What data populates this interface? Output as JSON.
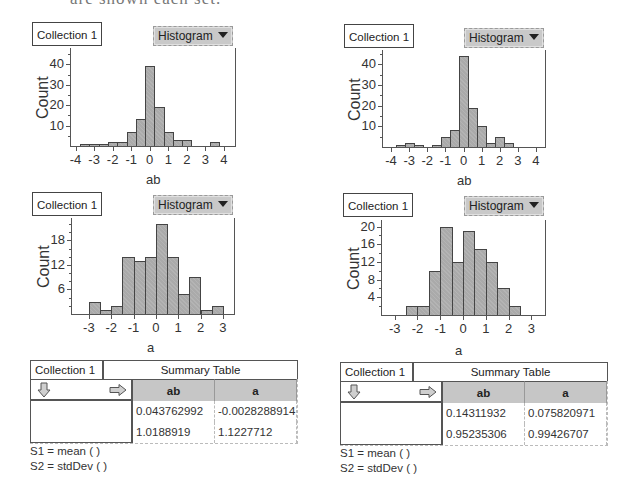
{
  "page": {
    "clipped_header_text": "are shown each set."
  },
  "colors": {
    "bar_fill": "#aaaaaa",
    "bar_stroke": "#444444",
    "button_bg": "#c9c9c9",
    "table_header_bg": "#c6c6c6"
  },
  "panels": [
    {
      "id": "top-left",
      "collection_label": "Collection 1",
      "plot_type_label": "Histogram",
      "ylabel": "Count",
      "xlabel": "ab",
      "layout": {
        "coll_x": 32,
        "coll_y": 22,
        "btn_x": 153,
        "btn_y": 26,
        "plot_x": 70,
        "plot_y": 48,
        "plot_w": 165,
        "plot_h": 98,
        "x_min": -4.3,
        "x_max": 4.6,
        "y_max": 48,
        "title_x": 146,
        "title_y": 172
      },
      "yticks": [
        10,
        20,
        30,
        40
      ],
      "yminor": 5,
      "xticks": [
        -4,
        -3,
        -2,
        -1,
        0,
        1,
        2,
        3,
        4
      ]
    },
    {
      "id": "top-right",
      "collection_label": "Collection 1",
      "plot_type_label": "Histogram",
      "ylabel": "Count",
      "xlabel": "ab",
      "layout": {
        "coll_x": 344,
        "coll_y": 24,
        "btn_x": 464,
        "btn_y": 28,
        "plot_x": 382,
        "plot_y": 50,
        "plot_w": 163,
        "plot_h": 97,
        "x_min": -4.5,
        "x_max": 4.5,
        "y_max": 47,
        "title_x": 457,
        "title_y": 173
      },
      "yticks": [
        10,
        20,
        30,
        40
      ],
      "yminor": 5,
      "xticks": [
        -4,
        -3,
        -2,
        -1,
        0,
        1,
        2,
        3,
        4
      ]
    },
    {
      "id": "middle-left",
      "collection_label": "Collection 1",
      "plot_type_label": "Histogram",
      "ylabel": "Count",
      "xlabel": "a",
      "layout": {
        "coll_x": 32,
        "coll_y": 192,
        "btn_x": 153,
        "btn_y": 195,
        "plot_x": 71,
        "plot_y": 218,
        "plot_w": 163,
        "plot_h": 96,
        "x_min": -3.8,
        "x_max": 3.5,
        "y_max": 23.5,
        "title_x": 147,
        "title_y": 340
      },
      "yticks": [
        6,
        12,
        18
      ],
      "yminor": 2,
      "xticks": [
        -3,
        -2,
        -1,
        0,
        1,
        2,
        3
      ]
    },
    {
      "id": "middle-right",
      "collection_label": "Collection 1",
      "plot_type_label": "Histogram",
      "ylabel": "Count",
      "xlabel": "a",
      "layout": {
        "coll_x": 343,
        "coll_y": 193,
        "btn_x": 464,
        "btn_y": 196,
        "plot_x": 381,
        "plot_y": 220,
        "plot_w": 164,
        "plot_h": 95,
        "x_min": -3.6,
        "x_max": 3.6,
        "y_max": 21.5,
        "title_x": 455,
        "title_y": 343
      },
      "yticks": [
        4,
        8,
        12,
        16,
        20
      ],
      "yminor": 2,
      "xticks": [
        -3,
        -2,
        -1,
        0,
        1,
        2,
        3
      ]
    }
  ],
  "chart_data": [
    {
      "type": "bar",
      "title": "Histogram of ab (Collection 1, left)",
      "xlabel": "ab",
      "ylabel": "Count",
      "bin_width": 0.5,
      "bins": [
        {
          "x0": -3.75,
          "x1": -3.25,
          "count": 1
        },
        {
          "x0": -3.25,
          "x1": -2.75,
          "count": 1
        },
        {
          "x0": -2.75,
          "x1": -2.25,
          "count": 1
        },
        {
          "x0": -2.25,
          "x1": -1.75,
          "count": 2
        },
        {
          "x0": -1.75,
          "x1": -1.25,
          "count": 2
        },
        {
          "x0": -1.25,
          "x1": -0.75,
          "count": 7
        },
        {
          "x0": -0.75,
          "x1": -0.25,
          "count": 13
        },
        {
          "x0": -0.25,
          "x1": 0.25,
          "count": 39
        },
        {
          "x0": 0.25,
          "x1": 0.75,
          "count": 19
        },
        {
          "x0": 0.75,
          "x1": 1.25,
          "count": 7
        },
        {
          "x0": 1.25,
          "x1": 1.75,
          "count": 3
        },
        {
          "x0": 1.75,
          "x1": 2.25,
          "count": 3
        },
        {
          "x0": 3.25,
          "x1": 3.75,
          "count": 2
        }
      ],
      "xlim": [
        -4.3,
        4.6
      ],
      "ylim": [
        0,
        48
      ],
      "xticks": [
        -4,
        -3,
        -2,
        -1,
        0,
        1,
        2,
        3,
        4
      ],
      "yticks": [
        10,
        20,
        30,
        40
      ]
    },
    {
      "type": "bar",
      "title": "Histogram of ab (Collection 1, right)",
      "xlabel": "ab",
      "ylabel": "Count",
      "bin_width": 0.5,
      "bins": [
        {
          "x0": -3.75,
          "x1": -3.25,
          "count": 1
        },
        {
          "x0": -3.25,
          "x1": -2.75,
          "count": 2
        },
        {
          "x0": -2.75,
          "x1": -2.25,
          "count": 1
        },
        {
          "x0": -1.75,
          "x1": -1.25,
          "count": 1
        },
        {
          "x0": -1.25,
          "x1": -0.75,
          "count": 5
        },
        {
          "x0": -0.75,
          "x1": -0.25,
          "count": 8
        },
        {
          "x0": -0.25,
          "x1": 0.25,
          "count": 44
        },
        {
          "x0": 0.25,
          "x1": 0.75,
          "count": 19
        },
        {
          "x0": 0.75,
          "x1": 1.25,
          "count": 10
        },
        {
          "x0": 1.25,
          "x1": 1.75,
          "count": 2
        },
        {
          "x0": 1.75,
          "x1": 2.25,
          "count": 5
        },
        {
          "x0": 2.25,
          "x1": 2.75,
          "count": 2
        }
      ],
      "xlim": [
        -4.5,
        4.5
      ],
      "ylim": [
        0,
        47
      ],
      "xticks": [
        -4,
        -3,
        -2,
        -1,
        0,
        1,
        2,
        3,
        4
      ],
      "yticks": [
        10,
        20,
        30,
        40
      ]
    },
    {
      "type": "bar",
      "title": "Histogram of a (Collection 1, left)",
      "xlabel": "a",
      "ylabel": "Count",
      "bin_width": 0.5,
      "bins": [
        {
          "x0": -3.0,
          "x1": -2.5,
          "count": 3
        },
        {
          "x0": -2.5,
          "x1": -2.0,
          "count": 1
        },
        {
          "x0": -2.0,
          "x1": -1.5,
          "count": 2
        },
        {
          "x0": -1.5,
          "x1": -1.0,
          "count": 14
        },
        {
          "x0": -1.0,
          "x1": -0.5,
          "count": 13
        },
        {
          "x0": -0.5,
          "x1": 0.0,
          "count": 14
        },
        {
          "x0": 0.0,
          "x1": 0.5,
          "count": 22
        },
        {
          "x0": 0.5,
          "x1": 1.0,
          "count": 14
        },
        {
          "x0": 1.0,
          "x1": 1.5,
          "count": 5
        },
        {
          "x0": 1.5,
          "x1": 2.0,
          "count": 9
        },
        {
          "x0": 2.0,
          "x1": 2.5,
          "count": 1
        },
        {
          "x0": 2.5,
          "x1": 3.0,
          "count": 2
        }
      ],
      "xlim": [
        -3.8,
        3.5
      ],
      "ylim": [
        0,
        23.5
      ],
      "xticks": [
        -3,
        -2,
        -1,
        0,
        1,
        2,
        3
      ],
      "yticks": [
        6,
        12,
        18
      ]
    },
    {
      "type": "bar",
      "title": "Histogram of a (Collection 1, right)",
      "xlabel": "a",
      "ylabel": "Count",
      "bin_width": 0.5,
      "bins": [
        {
          "x0": -2.5,
          "x1": -2.0,
          "count": 2
        },
        {
          "x0": -2.0,
          "x1": -1.5,
          "count": 2
        },
        {
          "x0": -1.5,
          "x1": -1.0,
          "count": 10
        },
        {
          "x0": -1.0,
          "x1": -0.5,
          "count": 20
        },
        {
          "x0": -0.5,
          "x1": 0.0,
          "count": 12
        },
        {
          "x0": 0.0,
          "x1": 0.5,
          "count": 19
        },
        {
          "x0": 0.5,
          "x1": 1.0,
          "count": 15
        },
        {
          "x0": 1.0,
          "x1": 1.5,
          "count": 12
        },
        {
          "x0": 1.5,
          "x1": 2.0,
          "count": 6
        },
        {
          "x0": 2.0,
          "x1": 2.5,
          "count": 2
        }
      ],
      "xlim": [
        -3.6,
        3.6
      ],
      "ylim": [
        0,
        21.5
      ],
      "xticks": [
        -3,
        -2,
        -1,
        0,
        1,
        2,
        3
      ],
      "yticks": [
        4,
        8,
        12,
        16,
        20
      ]
    },
    {
      "type": "table",
      "title": "Summary Table (left)",
      "columns": [
        "ab",
        "a"
      ],
      "rows": [
        {
          "formula": "S1 = mean ( )",
          "values": [
            "0.043762992",
            "-0.0028288914"
          ]
        },
        {
          "formula": "S2 = stdDev ( )",
          "values": [
            "1.0188919",
            "1.1227712"
          ]
        }
      ]
    },
    {
      "type": "table",
      "title": "Summary Table (right)",
      "columns": [
        "ab",
        "a"
      ],
      "rows": [
        {
          "formula": "S1 = mean ( )",
          "values": [
            "0.14311932",
            "0.075820971"
          ]
        },
        {
          "formula": "S2 = stdDev ( )",
          "values": [
            "0.95235306",
            "0.99426707"
          ]
        }
      ]
    }
  ],
  "summaries": [
    {
      "x": 30,
      "y": 360,
      "collection_label": "Collection 1",
      "title": "Summary Table",
      "col_headers": [
        "ab",
        "a"
      ],
      "row1": [
        "0.043762992",
        "-0.0028288914"
      ],
      "row2": [
        "1.0188919",
        "1.1227712"
      ],
      "formula1": "S1 = mean (  )",
      "formula2": "S2 = stdDev (  )"
    },
    {
      "x": 340,
      "y": 362,
      "collection_label": "Collection 1",
      "title": "Summary Table",
      "col_headers": [
        "ab",
        "a"
      ],
      "row1": [
        "0.14311932",
        "0.075820971"
      ],
      "row2": [
        "0.95235306",
        "0.99426707"
      ],
      "formula1": "S1 = mean (  )",
      "formula2": "S2 = stdDev (  )"
    }
  ],
  "icons": {
    "down_arrow": "down-arrow-icon",
    "right_arrow": "right-arrow-icon",
    "dropdown": "triangle-down-icon"
  }
}
